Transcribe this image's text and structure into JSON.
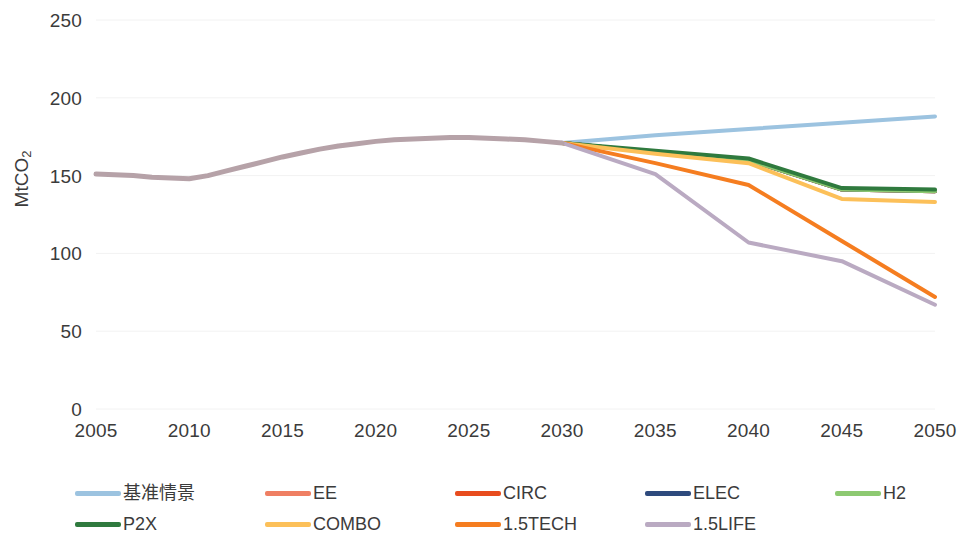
{
  "chart_data": {
    "type": "line",
    "title": "",
    "subtitle": "",
    "xlabel": "",
    "ylabel": "MtCO2",
    "ylabel_base": "MtCO",
    "ylabel_sub": "2",
    "xlim": [
      2005,
      2050
    ],
    "ylim": [
      0,
      250
    ],
    "y_ticks": [
      0,
      50,
      100,
      150,
      200,
      250
    ],
    "x_ticks": [
      2005,
      2010,
      2015,
      2020,
      2025,
      2030,
      2035,
      2040,
      2045,
      2050
    ],
    "x_tick_labels": [
      "2005",
      "2010",
      "2015",
      "2020",
      "2025",
      "2030",
      "2035",
      "2040",
      "2045",
      "2050"
    ],
    "y_tick_labels": [
      "0",
      "50",
      "100",
      "150",
      "200",
      "250"
    ],
    "grid": true,
    "grid_color": "#f2f2f2",
    "legend_position": "bottom",
    "history": {
      "name": "history",
      "color": "#b6a2a8",
      "x": [
        2005,
        2006,
        2007,
        2008,
        2009,
        2010,
        2011,
        2012,
        2013,
        2014,
        2015,
        2016,
        2017,
        2018,
        2019,
        2020,
        2021,
        2022,
        2023,
        2024,
        2025,
        2026,
        2027,
        2028,
        2029,
        2030
      ],
      "values": [
        151,
        150.5,
        150,
        149,
        148.5,
        148,
        150,
        153,
        156,
        159,
        162,
        164.5,
        167,
        169,
        170.5,
        172,
        173,
        173.5,
        174,
        174.5,
        174.5,
        174,
        173.5,
        173,
        172,
        171
      ]
    },
    "series": [
      {
        "name": "基准情景",
        "color": "#9cc3e0",
        "x": [
          2030,
          2035,
          2040,
          2045,
          2050
        ],
        "values": [
          171,
          176,
          180,
          184,
          188
        ]
      },
      {
        "name": "EE",
        "color": "#ef7f63",
        "x": [
          2030,
          2035,
          2040,
          2045,
          2050
        ],
        "values": [
          171,
          165,
          160,
          141,
          140
        ]
      },
      {
        "name": "CIRC",
        "color": "#e84c1e",
        "x": [
          2030,
          2035,
          2040,
          2045,
          2050
        ],
        "values": [
          171,
          165,
          160,
          141,
          140
        ]
      },
      {
        "name": "ELEC",
        "color": "#2e4a7d",
        "x": [
          2030,
          2035,
          2040,
          2045,
          2050
        ],
        "values": [
          171,
          165,
          160,
          141,
          140
        ]
      },
      {
        "name": "H2",
        "color": "#8dc971",
        "x": [
          2030,
          2035,
          2040,
          2045,
          2050
        ],
        "values": [
          171,
          165,
          160,
          141,
          140
        ]
      },
      {
        "name": "P2X",
        "color": "#2f7a3e",
        "x": [
          2030,
          2035,
          2040,
          2045,
          2050
        ],
        "values": [
          171,
          166,
          161,
          142,
          141
        ]
      },
      {
        "name": "COMBO",
        "color": "#fcc059",
        "x": [
          2030,
          2035,
          2040,
          2045,
          2050
        ],
        "values": [
          171,
          164,
          158,
          135,
          133
        ]
      },
      {
        "name": "1.5TECH",
        "color": "#f57d20",
        "x": [
          2030,
          2035,
          2040,
          2045,
          2050
        ],
        "values": [
          171,
          158,
          144,
          108,
          72
        ]
      },
      {
        "name": "1.5LIFE",
        "color": "#baaac2",
        "x": [
          2030,
          2035,
          2040,
          2045,
          2050
        ],
        "values": [
          171,
          151,
          107,
          95,
          67
        ]
      }
    ]
  },
  "legend": {
    "items": [
      {
        "label": "基准情景",
        "color": "#9cc3e0"
      },
      {
        "label": "EE",
        "color": "#ef7f63"
      },
      {
        "label": "CIRC",
        "color": "#e84c1e"
      },
      {
        "label": "ELEC",
        "color": "#2e4a7d"
      },
      {
        "label": "H2",
        "color": "#8dc971"
      },
      {
        "label": "P2X",
        "color": "#2f7a3e"
      },
      {
        "label": "COMBO",
        "color": "#fcc059"
      },
      {
        "label": "1.5TECH",
        "color": "#f57d20"
      },
      {
        "label": "1.5LIFE",
        "color": "#baaac2"
      }
    ]
  }
}
